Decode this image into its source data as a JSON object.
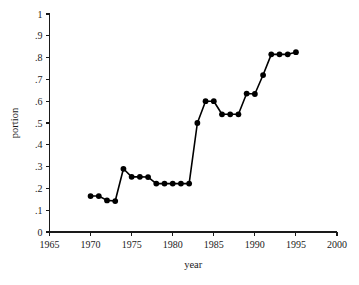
{
  "chart_data": {
    "type": "line",
    "title": "",
    "xlabel": "year",
    "ylabel": "portion",
    "xlim": [
      1965,
      2000
    ],
    "ylim": [
      0,
      1
    ],
    "grid": false,
    "legend": "none",
    "marker": "filled-circle",
    "xticks": [
      "1965",
      "1970",
      "1975",
      "1980",
      "1985",
      "1990",
      "1995",
      "2000"
    ],
    "xtick_values": [
      1965,
      1970,
      1975,
      1980,
      1985,
      1990,
      1995,
      2000
    ],
    "yticks": [
      "0",
      ".1",
      ".2",
      ".3",
      ".4",
      ".5",
      ".6",
      ".7",
      ".8",
      ".9",
      "1"
    ],
    "ytick_values": [
      0,
      0.1,
      0.2,
      0.3,
      0.4,
      0.5,
      0.6,
      0.7,
      0.8,
      0.9,
      1
    ],
    "x": [
      1970,
      1971,
      1972,
      1973,
      1974,
      1975,
      1976,
      1977,
      1978,
      1979,
      1980,
      1981,
      1982,
      1983,
      1984,
      1985,
      1986,
      1987,
      1988,
      1989,
      1990,
      1991,
      1992,
      1993,
      1994,
      1995
    ],
    "values": [
      0.165,
      0.165,
      0.145,
      0.142,
      0.29,
      0.253,
      0.253,
      0.252,
      0.222,
      0.222,
      0.222,
      0.222,
      0.222,
      0.5,
      0.6,
      0.6,
      0.54,
      0.54,
      0.54,
      0.635,
      0.633,
      0.72,
      0.815,
      0.815,
      0.815,
      0.825
    ],
    "series": [
      {
        "name": "portion",
        "color": "#000000",
        "values": [
          0.165,
          0.165,
          0.145,
          0.142,
          0.29,
          0.253,
          0.253,
          0.252,
          0.222,
          0.222,
          0.222,
          0.222,
          0.222,
          0.5,
          0.6,
          0.6,
          0.54,
          0.54,
          0.54,
          0.635,
          0.633,
          0.72,
          0.815,
          0.815,
          0.815,
          0.825
        ]
      }
    ]
  },
  "colors": {
    "line": "#000000",
    "marker": "#000000",
    "axis": "#1a1a1a",
    "background": "#ffffff"
  }
}
